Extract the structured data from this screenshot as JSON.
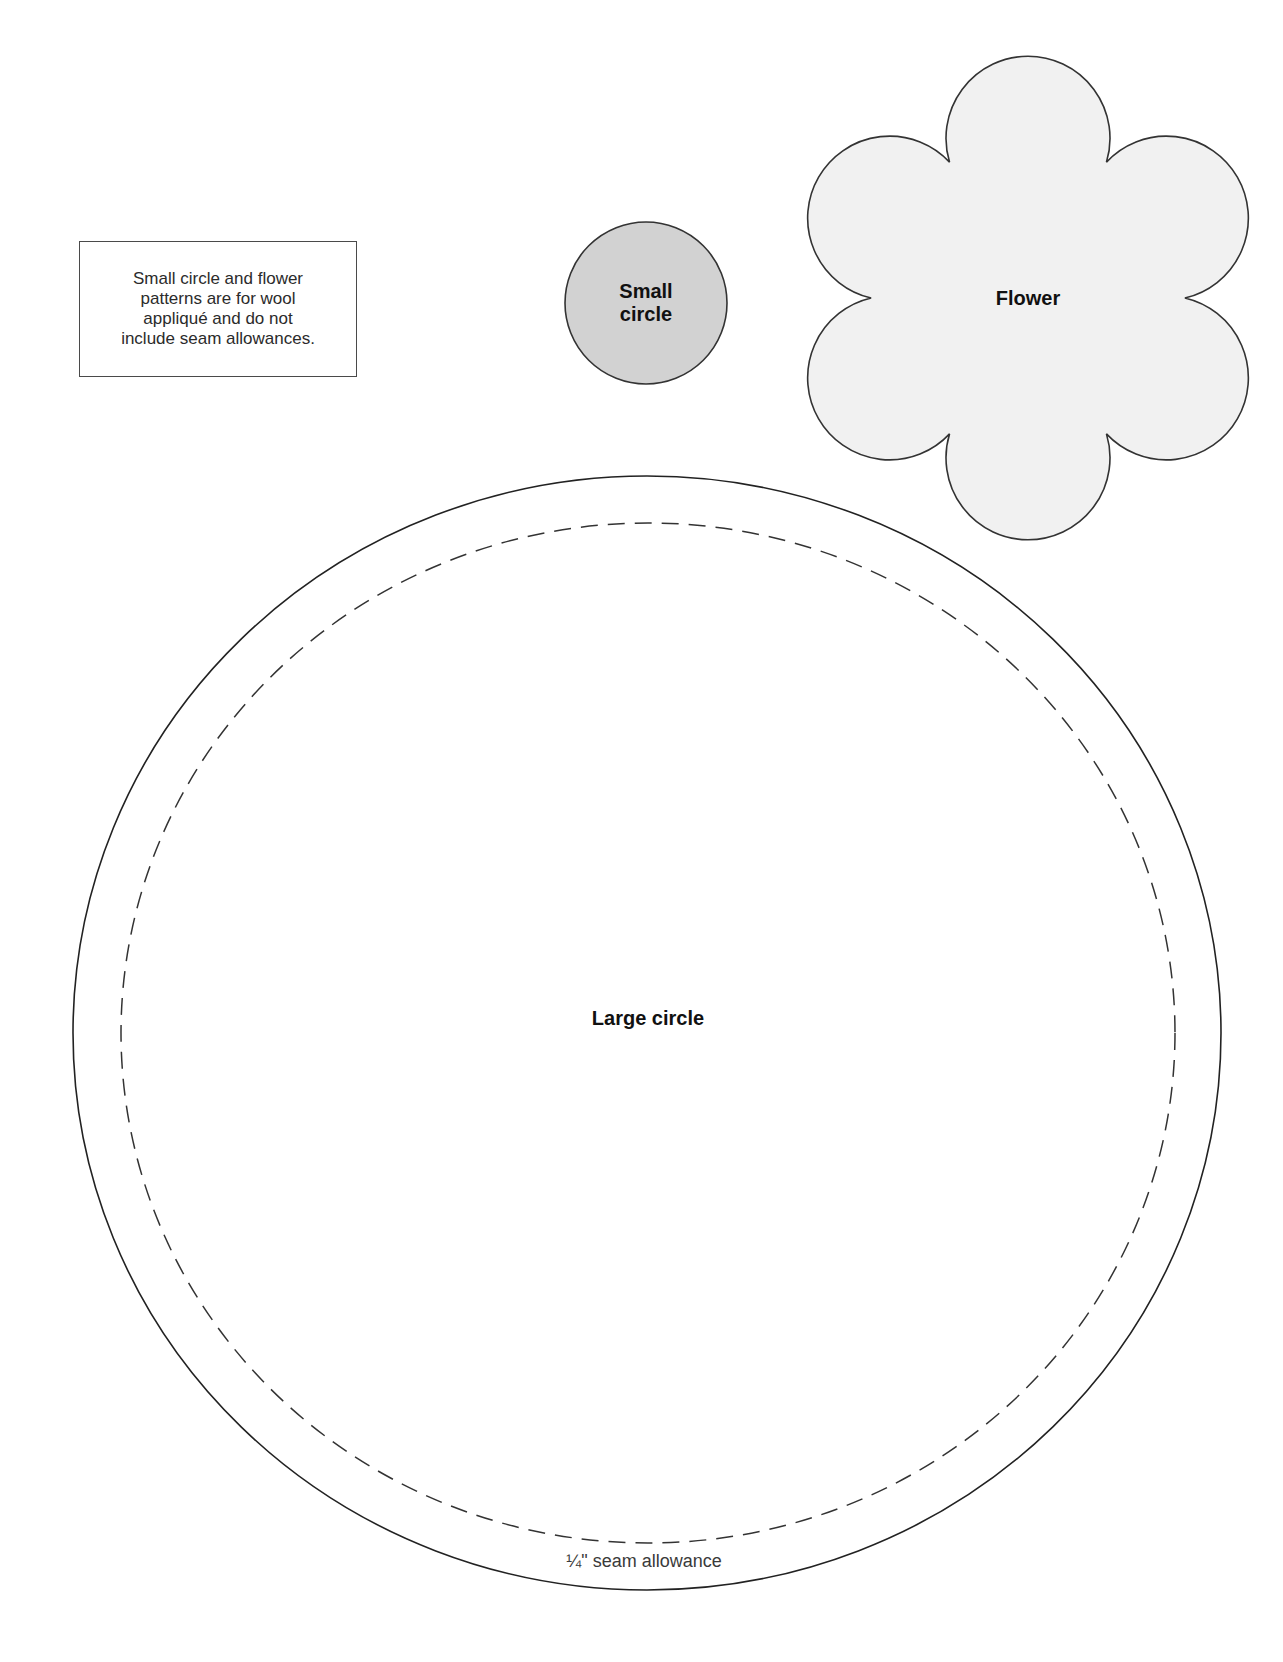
{
  "note": {
    "text": "Small circle and flower\npatterns are for wool\nappliqué and do not\ninclude seam allowances."
  },
  "shapes": {
    "small_circle": {
      "label": "Small\ncircle",
      "fill": "#d2d2d2",
      "stroke": "#333333"
    },
    "flower": {
      "label": "Flower",
      "fill": "#f1f1f1",
      "stroke": "#333333",
      "petals": 6
    },
    "large_circle": {
      "label": "Large circle",
      "fill": "#ffffff",
      "stroke": "#222222",
      "seam_line": "dashed",
      "seam_label": "¼\" seam allowance"
    }
  }
}
